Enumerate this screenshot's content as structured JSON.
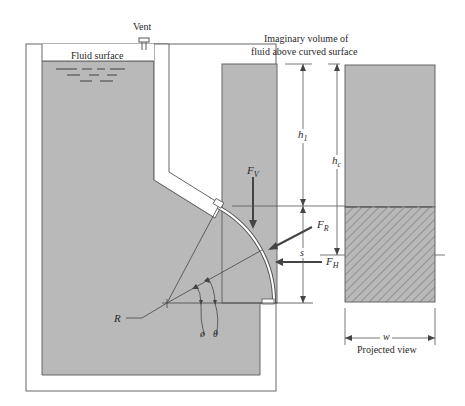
{
  "labels": {
    "vent": "Vent",
    "fluid_surface": "Fluid surface",
    "imaginary_volume_line1": "Imaginary volume of",
    "imaginary_volume_line2": "fluid above curved surface",
    "projected_view": "Projected view"
  },
  "symbols": {
    "h1": {
      "main": "h",
      "sub": "1"
    },
    "hc": {
      "main": "h",
      "sub": "c"
    },
    "fv": {
      "main": "F",
      "sub": "V"
    },
    "fr": {
      "main": "F",
      "sub": "R"
    },
    "fh": {
      "main": "F",
      "sub": "H"
    },
    "s": "s",
    "w": "w",
    "R": "R",
    "phi": "ø",
    "theta": "θ"
  },
  "colors": {
    "fluid": "#b9b9b9",
    "lines": "#555555",
    "background": "#ffffff",
    "text": "#2a2a2a"
  }
}
